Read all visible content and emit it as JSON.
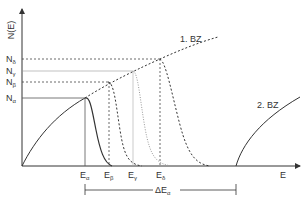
{
  "diagram": {
    "y_axis_label": "N(E)",
    "x_axis_label": "E",
    "zone1_label": "1. BZ",
    "zone2_label": "2. BZ",
    "levels": [
      {
        "name": "N",
        "sub": "α",
        "energy": "E",
        "esub": "α",
        "style": "solid"
      },
      {
        "name": "N",
        "sub": "β",
        "energy": "E",
        "esub": "β",
        "style": "dashed"
      },
      {
        "name": "N",
        "sub": "γ",
        "energy": "E",
        "esub": "γ",
        "style": "dotted"
      },
      {
        "name": "N",
        "sub": "δ",
        "energy": "E",
        "esub": "δ",
        "style": "dashed"
      }
    ],
    "gap_label": "ΔE",
    "gap_sub": "α"
  },
  "colors": {
    "line": "#333333",
    "light": "#888888"
  }
}
